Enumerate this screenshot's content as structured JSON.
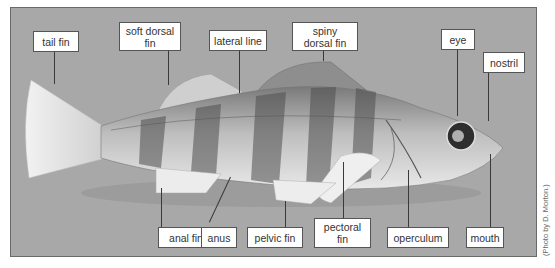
{
  "figure": {
    "photo_credit": "(Photo by D. Morton.)"
  },
  "labels": {
    "tail_fin": "tail fin",
    "soft_dorsal_fin": "soft dorsal\nfin",
    "lateral_line": "lateral line",
    "spiny_dorsal_fin": "spiny\ndorsal fin",
    "eye": "eye",
    "nostril": "nostril",
    "anal_fin": "anal fin",
    "anus": "anus",
    "pelvic_fin": "pelvic fin",
    "pectoral_fin": "pectoral\nfin",
    "operculum": "operculum",
    "mouth": "mouth"
  },
  "colors": {
    "background": "#a8a8a8",
    "label_bg": "#ffffff",
    "label_border": "#555555",
    "fish_light": "#e6e6e6",
    "fish_dark": "#4a4a4a"
  }
}
